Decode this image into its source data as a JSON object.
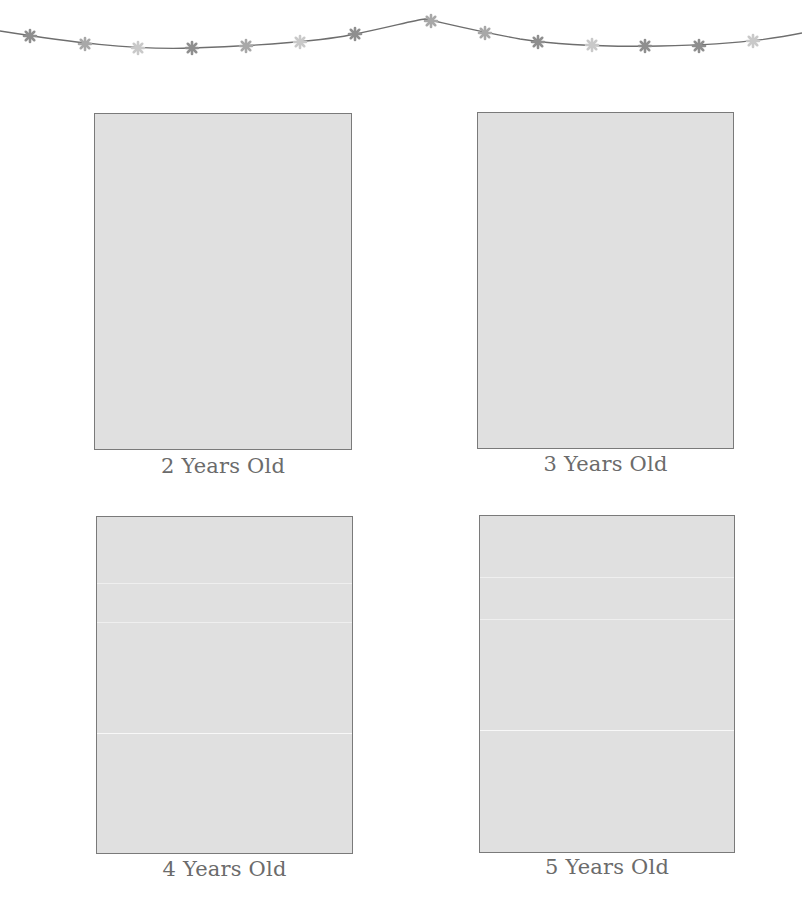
{
  "garland": {
    "string_color": "#6e6e6e",
    "flower_colors": [
      "#8f8f8f",
      "#a8a8a8",
      "#c9c9c9"
    ],
    "flowers": [
      {
        "x": 30,
        "y": 36,
        "shade": 0
      },
      {
        "x": 85,
        "y": 44,
        "shade": 1
      },
      {
        "x": 138,
        "y": 48,
        "shade": 2
      },
      {
        "x": 192,
        "y": 48,
        "shade": 0
      },
      {
        "x": 246,
        "y": 46,
        "shade": 1
      },
      {
        "x": 300,
        "y": 42,
        "shade": 2
      },
      {
        "x": 355,
        "y": 34,
        "shade": 0
      },
      {
        "x": 431,
        "y": 21,
        "shade": 1
      },
      {
        "x": 485,
        "y": 33,
        "shade": 1
      },
      {
        "x": 538,
        "y": 42,
        "shade": 0
      },
      {
        "x": 592,
        "y": 45,
        "shade": 2
      },
      {
        "x": 645,
        "y": 46,
        "shade": 0
      },
      {
        "x": 699,
        "y": 46,
        "shade": 0
      },
      {
        "x": 753,
        "y": 41,
        "shade": 2
      }
    ]
  },
  "photos": [
    {
      "id": "age-2",
      "caption": "2 Years Old",
      "box": {
        "x": 94,
        "y": 113,
        "w": 258,
        "h": 337
      },
      "caption_y": 454,
      "folds": []
    },
    {
      "id": "age-3",
      "caption": "3 Years Old",
      "box": {
        "x": 477,
        "y": 112,
        "w": 257,
        "h": 337
      },
      "caption_y": 452,
      "folds": []
    },
    {
      "id": "age-4",
      "caption": "4 Years Old",
      "box": {
        "x": 96,
        "y": 516,
        "w": 257,
        "h": 338
      },
      "caption_y": 857,
      "folds": [
        {
          "y": 66,
          "strong": false
        },
        {
          "y": 105,
          "strong": false
        },
        {
          "y": 216,
          "strong": true
        }
      ]
    },
    {
      "id": "age-5",
      "caption": "5 Years Old",
      "box": {
        "x": 479,
        "y": 515,
        "w": 256,
        "h": 338
      },
      "caption_y": 855,
      "folds": [
        {
          "y": 61,
          "strong": false
        },
        {
          "y": 103,
          "strong": false
        },
        {
          "y": 214,
          "strong": true
        }
      ]
    }
  ],
  "colors": {
    "background": "#ffffff",
    "photo_fill": "#e0e0e0",
    "photo_border": "#7a7a7a",
    "caption_text": "#6b6b6b"
  }
}
